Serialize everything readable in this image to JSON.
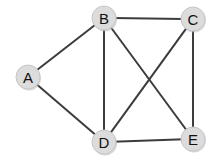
{
  "diagram": {
    "type": "node-link-graph",
    "canvas": {
      "width": 219,
      "height": 164,
      "background": "#ffffff"
    },
    "style": {
      "node_fill": "#dcdcdc",
      "node_stroke": "#c6c6c6",
      "node_radius": 12,
      "edge_color": "#3c3c3c",
      "edge_width": 2,
      "label_color": "#111111"
    },
    "nodes": [
      {
        "id": "A",
        "label": "A",
        "x": 28,
        "y": 77
      },
      {
        "id": "B",
        "label": "B",
        "x": 104,
        "y": 18
      },
      {
        "id": "C",
        "label": "C",
        "x": 193,
        "y": 19
      },
      {
        "id": "D",
        "label": "D",
        "x": 104,
        "y": 142
      },
      {
        "id": "E",
        "label": "E",
        "x": 193,
        "y": 139
      }
    ],
    "edges": [
      {
        "id": "A-B",
        "from": "A",
        "to": "B"
      },
      {
        "id": "A-D",
        "from": "A",
        "to": "D"
      },
      {
        "id": "B-C",
        "from": "B",
        "to": "C"
      },
      {
        "id": "B-D",
        "from": "B",
        "to": "D"
      },
      {
        "id": "B-E",
        "from": "B",
        "to": "E"
      },
      {
        "id": "C-D",
        "from": "C",
        "to": "D"
      },
      {
        "id": "C-E",
        "from": "C",
        "to": "E"
      },
      {
        "id": "D-E",
        "from": "D",
        "to": "E"
      }
    ]
  }
}
